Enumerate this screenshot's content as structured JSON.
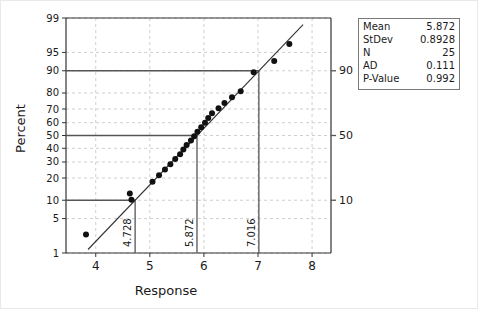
{
  "chart_data": {
    "type": "scatter",
    "title": "",
    "xlabel": "Response",
    "ylabel": "Percent",
    "xlim": [
      3.45,
      8.35
    ],
    "ylim": [
      1,
      99
    ],
    "grid": true,
    "y_scale": "normal-probability",
    "xticks": [
      4,
      5,
      6,
      7,
      8
    ],
    "xticklabels": [
      "4",
      "5",
      "6",
      "7",
      "8"
    ],
    "yticks": [
      1,
      5,
      10,
      20,
      30,
      40,
      50,
      60,
      70,
      80,
      90,
      95,
      99
    ],
    "yticklabels": [
      "1",
      "5",
      "10",
      "20",
      "30",
      "40",
      "50",
      "60",
      "70",
      "80",
      "90",
      "95",
      "99"
    ],
    "right_axis_labels": [
      "90",
      "50",
      "10"
    ],
    "right_axis_values": [
      90,
      50,
      10
    ],
    "reference_lines": [
      {
        "percent": 10,
        "response": 4.728,
        "label": "4.728"
      },
      {
        "percent": 50,
        "response": 5.872,
        "label": "5.872"
      },
      {
        "percent": 90,
        "response": 7.016,
        "label": "7.016"
      }
    ],
    "fit_line": {
      "mean": 5.872,
      "stdev": 0.8928
    },
    "x": [
      3.82,
      4.63,
      4.66,
      5.05,
      5.17,
      5.28,
      5.38,
      5.47,
      5.56,
      5.62,
      5.68,
      5.76,
      5.82,
      5.88,
      5.95,
      6.02,
      6.08,
      6.15,
      6.27,
      6.38,
      6.52,
      6.68,
      6.92,
      7.3,
      7.58
    ],
    "percent": [
      2.5,
      12.5,
      10.2,
      18.0,
      21.5,
      25.0,
      28.5,
      32.0,
      35.5,
      39.0,
      42.5,
      46.0,
      49.5,
      53.0,
      56.5,
      60.0,
      63.5,
      67.0,
      70.5,
      74.0,
      77.5,
      81.0,
      89.5,
      93.0,
      96.5
    ]
  },
  "stats": {
    "rows": [
      {
        "key": "Mean",
        "value": "5.872"
      },
      {
        "key": "StDev",
        "value": "0.8928"
      },
      {
        "key": "N",
        "value": "25"
      },
      {
        "key": "AD",
        "value": "0.111"
      },
      {
        "key": "P-Value",
        "value": "0.992"
      }
    ]
  },
  "colors": {
    "axis": "#333333",
    "grid": "#cfcfcf",
    "marker": "#111111",
    "reference": "#555555",
    "text": "#1a1a1a"
  }
}
